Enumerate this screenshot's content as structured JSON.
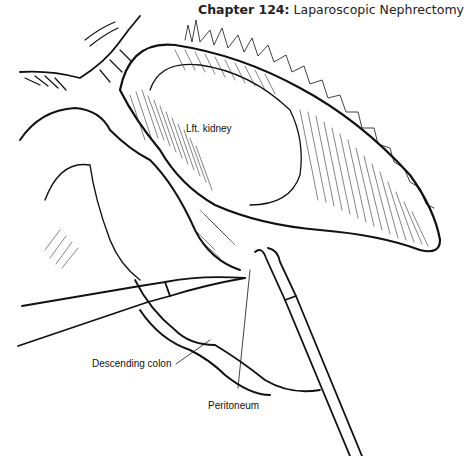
{
  "header": {
    "chapter": "Chapter 124:",
    "title": "Laparoscopic Nephrectomy"
  },
  "figure": {
    "labels": {
      "kidney": "Lft. kidney",
      "colon": "Descending colon",
      "peritoneum": "Peritoneum"
    }
  }
}
